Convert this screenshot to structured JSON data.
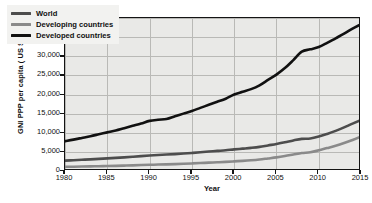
{
  "chart_data": {
    "type": "line",
    "title": "",
    "xlabel": "Year",
    "ylabel": "GNI PPP per capita ( US $)",
    "xlim": [
      1980,
      2015
    ],
    "ylim": [
      0,
      40000
    ],
    "grid": true,
    "legend_position": "top-left",
    "xticks": [
      "1980",
      "1985",
      "1990",
      "1995",
      "2000",
      "2005",
      "2010",
      "2015"
    ],
    "xtick_values": [
      1980,
      1985,
      1990,
      1995,
      2000,
      2005,
      2010,
      2015
    ],
    "yticks": [
      "0",
      "5,000",
      "10,000",
      "15,000",
      "20,000",
      "25,000",
      "30,000",
      "35,000",
      "40,000"
    ],
    "ytick_values": [
      0,
      5000,
      10000,
      15000,
      20000,
      25000,
      30000,
      35000,
      40000
    ],
    "x": [
      1980,
      1981,
      1982,
      1983,
      1984,
      1985,
      1986,
      1987,
      1988,
      1989,
      1990,
      1991,
      1992,
      1993,
      1994,
      1995,
      1996,
      1997,
      1998,
      1999,
      2000,
      2001,
      2002,
      2003,
      2004,
      2005,
      2006,
      2007,
      2008,
      2009,
      2010,
      2011,
      2012,
      2013,
      2014,
      2015
    ],
    "series": [
      {
        "name": "World",
        "color": "#4d4d4d",
        "values": [
          2700,
          2820,
          2930,
          3040,
          3160,
          3300,
          3420,
          3560,
          3720,
          3880,
          4040,
          4180,
          4300,
          4420,
          4560,
          4720,
          4900,
          5080,
          5250,
          5420,
          5650,
          5840,
          6040,
          6300,
          6680,
          7060,
          7500,
          8000,
          8400,
          8500,
          9000,
          9700,
          10500,
          11400,
          12400,
          13300
        ]
      },
      {
        "name": "Developing countries",
        "color": "#8a8a8a",
        "values": [
          1100,
          1130,
          1160,
          1200,
          1250,
          1300,
          1350,
          1410,
          1480,
          1550,
          1620,
          1680,
          1740,
          1810,
          1890,
          1980,
          2080,
          2190,
          2280,
          2380,
          2520,
          2650,
          2800,
          3000,
          3280,
          3560,
          3900,
          4300,
          4700,
          4900,
          5400,
          6000,
          6600,
          7300,
          8100,
          9000
        ]
      },
      {
        "name": "Developed countries",
        "color": "#111111",
        "values": [
          7800,
          8200,
          8650,
          9100,
          9600,
          10100,
          10600,
          11200,
          11800,
          12400,
          13100,
          13400,
          13600,
          14300,
          15000,
          15700,
          16500,
          17300,
          18100,
          18900,
          20000,
          20700,
          21400,
          22400,
          23800,
          25200,
          26900,
          29000,
          31200,
          31800,
          32400,
          33500,
          34700,
          35900,
          37200,
          38400
        ]
      }
    ],
    "notes": {
      "developed_2008_2009_plateau": "Developed countries curve flattens near 31,000-32,000 during 2008-2009",
      "developed_1990_plateau": "Slight flattening near 13,400-13,600 around 1991-1992"
    }
  }
}
